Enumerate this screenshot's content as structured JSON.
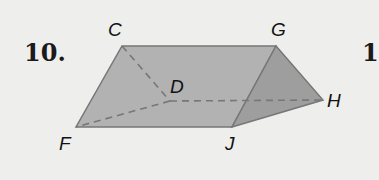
{
  "problem": {
    "number": "10.",
    "next_number_partial": "1"
  },
  "figure": {
    "type": "triangular prism",
    "vertices": {
      "C": "C",
      "G": "G",
      "D": "D",
      "H": "H",
      "F": "F",
      "J": "J"
    },
    "hidden_edges": [
      "CD",
      "DF",
      "DH"
    ],
    "colors": {
      "face_front": "#a8a8a8",
      "face_top": "#b4b4b4",
      "face_end": "#9a9a9a",
      "edge": "#6f6f6f",
      "background": "#eeeeec"
    }
  }
}
